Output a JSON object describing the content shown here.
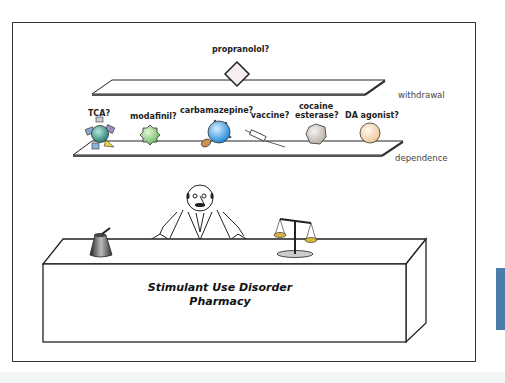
{
  "figure": {
    "withdrawal_drugs": [
      {
        "label": "propranolol?",
        "shape": "diamond",
        "color": "#f7eef0"
      }
    ],
    "dependence_drugs": [
      {
        "label": "TCA?",
        "shape": "multi-receptor-sphere",
        "color": "#3e9a8c"
      },
      {
        "label": "modafinil?",
        "shape": "spiky-sphere",
        "color": "#8ccc7e"
      },
      {
        "label": "carbamazepine?",
        "shape": "sphere-with-pill",
        "color": "#3ea0e0"
      },
      {
        "label": "vaccine?",
        "shape": "syringe",
        "color": "#ffffff"
      },
      {
        "label": "cocaine esterase?",
        "label_line1": "cocaine",
        "label_line2": "esterase?",
        "shape": "hexagon",
        "color": "#d8d4cc"
      },
      {
        "label": "DA agonist?",
        "shape": "sphere",
        "color": "#f5dcb4"
      }
    ],
    "platform_labels": {
      "withdrawal": "withdrawal",
      "dependence": "dependence"
    },
    "counter": {
      "title_line1": "Stimulant Use Disorder",
      "title_line2": "Pharmacy"
    },
    "props": [
      "mortar-and-pestle",
      "pharmacist",
      "balance-scale"
    ]
  },
  "colors": {
    "frame": "#333333",
    "side_tab": "#4a7ea8"
  }
}
